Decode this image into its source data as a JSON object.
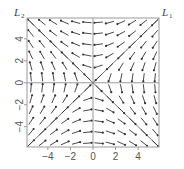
{
  "chart_data": {
    "type": "vector_field",
    "title": "",
    "xlabel": "",
    "ylabel": "",
    "xlim": [
      -5.85,
      5.85
    ],
    "ylim": [
      -5.85,
      5.9
    ],
    "x_ticks": [
      -4,
      -2,
      0,
      2,
      4
    ],
    "y_ticks": [
      -4,
      -2,
      0,
      2,
      4
    ],
    "grid": false,
    "system": {
      "dx": "-y",
      "dy": "-x"
    },
    "field_grid": {
      "start": -5.5,
      "end": 5.5,
      "step": 1.0
    },
    "arrow_length_units": 0.75,
    "reference_lines": [
      {
        "name": "L1",
        "label_main": "L",
        "label_sub": "1",
        "equation": "y = x",
        "role": "stable eigen-direction"
      },
      {
        "name": "L2",
        "label_main": "L",
        "label_sub": "2",
        "equation": "y = -x",
        "role": "unstable eigen-direction"
      }
    ],
    "axes_lines": [
      "x = 0",
      "y = 0"
    ]
  },
  "colors": {
    "frame": "#9a9a9a",
    "axis_lines": "#9a9a9a",
    "ref_lines": "#777777",
    "arrows": "#333333",
    "tick_text": "#555555"
  }
}
